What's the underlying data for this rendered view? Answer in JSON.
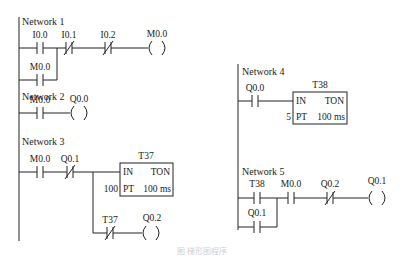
{
  "diagram": {
    "type": "ladder-logic",
    "networks": [
      {
        "label": "Network 1",
        "contacts": [
          {
            "address": "I0.0",
            "type": "NO"
          },
          {
            "address": "I0.1",
            "type": "NC"
          },
          {
            "address": "I0.2",
            "type": "NC"
          }
        ],
        "parallel_contact": {
          "address": "M0.0",
          "type": "NO"
        },
        "coil": {
          "address": "M0.0"
        }
      },
      {
        "label": "Network 2",
        "contacts": [
          {
            "address": "M0.0",
            "type": "NO"
          }
        ],
        "coil": {
          "address": "Q0.0"
        }
      },
      {
        "label": "Network 3",
        "contacts": [
          {
            "address": "M0.0",
            "type": "NO"
          },
          {
            "address": "Q0.1",
            "type": "NC"
          }
        ],
        "timer": {
          "name": "T37",
          "in": "IN",
          "type": "TON",
          "pt_label": "PT",
          "pt_value": "100",
          "base": "100 ms"
        },
        "branch": {
          "contact": {
            "address": "T37",
            "type": "NC"
          },
          "coil": {
            "address": "Q0.2"
          }
        }
      },
      {
        "label": "Network 4",
        "contacts": [
          {
            "address": "Q0.0",
            "type": "NO"
          }
        ],
        "timer": {
          "name": "T38",
          "in": "IN",
          "type": "TON",
          "pt_label": "PT",
          "pt_value": "5",
          "base": "100 ms"
        }
      },
      {
        "label": "Network 5",
        "contacts": [
          {
            "address": "T38",
            "type": "NO"
          },
          {
            "address": "M0.0",
            "type": "NO"
          },
          {
            "address": "Q0.2",
            "type": "NC"
          }
        ],
        "parallel_contact": {
          "address": "Q0.1",
          "type": "NO"
        },
        "coil": {
          "address": "Q0.1"
        }
      }
    ],
    "caption": "图 梯形图程序"
  }
}
